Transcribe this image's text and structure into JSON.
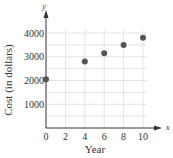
{
  "chart_data": {
    "type": "scatter",
    "title": "",
    "xlabel": "Year",
    "ylabel": "Cost (in dollars)",
    "x_axis_symbol": "x",
    "y_axis_symbol": "y",
    "xlim": [
      0,
      10
    ],
    "ylim": [
      0,
      4000
    ],
    "x_ticks": [
      0,
      2,
      4,
      6,
      8,
      10
    ],
    "y_ticks": [
      1000,
      2000,
      3000,
      4000
    ],
    "grid": true,
    "grid_x_step": 2,
    "grid_y_step": 500,
    "legend": null,
    "x": [
      0,
      4,
      6,
      8,
      10
    ],
    "y": [
      2050,
      2800,
      3150,
      3500,
      3800
    ],
    "point_color": "#555555",
    "grid_color": "#dddddd",
    "axis_color": "#333333"
  }
}
